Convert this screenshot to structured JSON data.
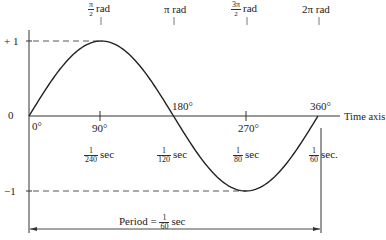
{
  "diagram": {
    "y_labels": {
      "plus_one": "+ 1",
      "zero": "0",
      "minus_one": "−1"
    },
    "x_axis_label": "Time axis",
    "degree_labels": [
      "0°",
      "90°",
      "180°",
      "270°",
      "360°"
    ],
    "radian_labels": [
      {
        "num": "π",
        "den": "2",
        "unit": "rad"
      },
      {
        "text": "π rad"
      },
      {
        "num": "3π",
        "den": "2",
        "unit": "rad"
      },
      {
        "text": "2π rad"
      }
    ],
    "time_labels": [
      {
        "num": "1",
        "den": "240",
        "unit": "sec"
      },
      {
        "num": "1",
        "den": "120",
        "unit": "sec"
      },
      {
        "num": "1",
        "den": "80",
        "unit": "sec"
      },
      {
        "num": "1",
        "den": "60",
        "unit": "sec."
      }
    ],
    "period_label": {
      "prefix": "Period =",
      "num": "1",
      "den": "60",
      "unit": "sec"
    },
    "colors": {
      "line": "#222222",
      "background": "#ffffff"
    }
  }
}
